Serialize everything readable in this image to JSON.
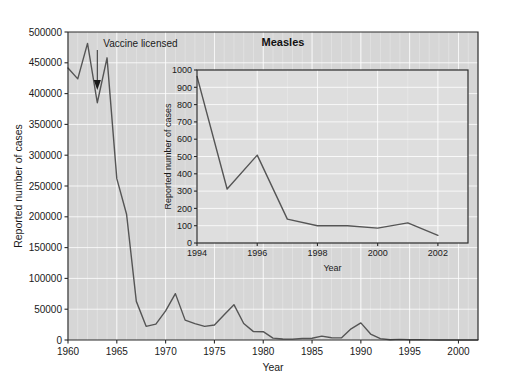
{
  "figure": {
    "name": "measles-reported-cases-figure",
    "background_color": "#ffffff",
    "plot_background_color": "#d6d6d6",
    "inset_background_color": "#dedede",
    "line_color": "#555555",
    "axis_color": "#2b2b2b",
    "gridline_color": "#ffffff"
  },
  "annotation": {
    "vaccine_label": "Vaccine licensed",
    "vaccine_year": 1963,
    "arrow_icon": "down-arrow-icon"
  },
  "main": {
    "title": "",
    "xlabel": "Year",
    "ylabel": "Reported number of cases",
    "x_ticks": [
      "1960",
      "1965",
      "1970",
      "1975",
      "1980",
      "1985",
      "1990",
      "1995",
      "2000"
    ],
    "y_ticks": [
      "0",
      "50000",
      "100000",
      "150000",
      "200000",
      "250000",
      "300000",
      "350000",
      "400000",
      "450000",
      "500000"
    ]
  },
  "inset": {
    "title": "Measles",
    "xlabel": "Year",
    "ylabel": "Reported number of cases",
    "x_ticks": [
      "1994",
      "1996",
      "1998",
      "2000",
      "2002"
    ],
    "y_ticks": [
      "0",
      "100",
      "200",
      "300",
      "400",
      "500",
      "600",
      "700",
      "800",
      "900",
      "1000"
    ]
  },
  "chart_data": [
    {
      "id": "main-chart",
      "type": "line",
      "title": "",
      "xlabel": "Year",
      "ylabel": "Reported number of cases",
      "xlim": [
        1960,
        2002
      ],
      "ylim": [
        0,
        500000
      ],
      "xticks": [
        1960,
        1965,
        1970,
        1975,
        1980,
        1985,
        1990,
        1995,
        2000
      ],
      "yticks": [
        0,
        50000,
        100000,
        150000,
        200000,
        250000,
        300000,
        350000,
        400000,
        450000,
        500000
      ],
      "grid": true,
      "legend": "none",
      "annotations": [
        {
          "text": "Vaccine licensed",
          "x": 1963,
          "y": 410000,
          "arrow": "down"
        }
      ],
      "x": [
        1960,
        1961,
        1962,
        1963,
        1964,
        1965,
        1966,
        1967,
        1968,
        1969,
        1970,
        1971,
        1972,
        1973,
        1974,
        1975,
        1976,
        1977,
        1978,
        1979,
        1980,
        1981,
        1982,
        1983,
        1984,
        1985,
        1986,
        1987,
        1988,
        1989,
        1990,
        1991,
        1992,
        1993,
        1994,
        1995,
        1996,
        1997,
        1998,
        1999,
        2000,
        2001,
        2002
      ],
      "y": [
        441703,
        423919,
        481530,
        385156,
        458083,
        261904,
        204136,
        62705,
        22231,
        25826,
        47351,
        75290,
        32275,
        26690,
        22094,
        24374,
        41126,
        57345,
        26871,
        13597,
        13506,
        3124,
        1714,
        1497,
        2587,
        2822,
        6282,
        3655,
        3396,
        18193,
        27786,
        9643,
        2237,
        312,
        963,
        312,
        508,
        138,
        100,
        100,
        86,
        116,
        44
      ]
    },
    {
      "id": "inset-chart",
      "type": "line",
      "title": "Measles",
      "xlabel": "Year",
      "ylabel": "Reported number of cases",
      "xlim": [
        1994,
        2003
      ],
      "ylim": [
        0,
        1000
      ],
      "xticks": [
        1994,
        1996,
        1998,
        2000,
        2002
      ],
      "yticks": [
        0,
        100,
        200,
        300,
        400,
        500,
        600,
        700,
        800,
        900,
        1000
      ],
      "grid": true,
      "legend": "none",
      "x": [
        1994,
        1995,
        1996,
        1997,
        1998,
        1999,
        2000,
        2001,
        2002
      ],
      "y": [
        963,
        312,
        508,
        138,
        100,
        100,
        86,
        116,
        44
      ]
    }
  ]
}
